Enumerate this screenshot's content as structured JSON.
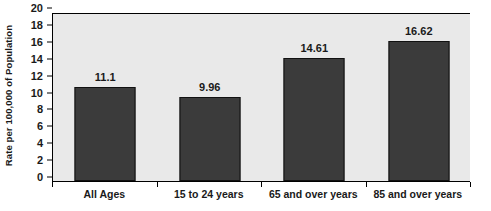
{
  "chart_data": {
    "type": "bar",
    "title": "",
    "xlabel": "",
    "ylabel": "Rate per 100,000 of Population",
    "categories": [
      "All Ages",
      "15 to 24 years",
      "65 and over years",
      "85 and over years"
    ],
    "values": [
      11.1,
      9.96,
      14.61,
      16.62
    ],
    "value_labels": [
      "11.1",
      "9.96",
      "14.61",
      "16.62"
    ],
    "ylim": [
      0,
      20
    ],
    "ytick_step": 2,
    "yticks": [
      0,
      2,
      4,
      6,
      8,
      10,
      12,
      14,
      16,
      18,
      20
    ],
    "ytick_labels": [
      "0",
      "2",
      "4",
      "6",
      "8",
      "10",
      "12",
      "14",
      "16",
      "18",
      "20"
    ],
    "grid": false,
    "legend": null,
    "legend_position": "none",
    "series": [
      {
        "name": "Rate per 100,000 of Population",
        "values": [
          11.1,
          9.96,
          14.61,
          16.62
        ]
      }
    ],
    "colors": {
      "bar_fill": "#3b3b3b",
      "bar_border": "#111111",
      "plot_background": "#e9e9e9",
      "axis": "#000000",
      "text": "#1a1a1a",
      "page_background": "#ffffff"
    }
  }
}
